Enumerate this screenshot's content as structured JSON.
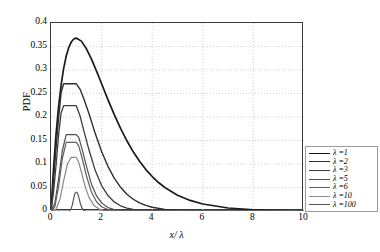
{
  "chart_data": {
    "type": "line",
    "title": "",
    "xlabel": "x/ λ",
    "ylabel": "PDF",
    "xlim": [
      0,
      10
    ],
    "ylim": [
      0,
      0.4
    ],
    "xticks": [
      0,
      2,
      4,
      6,
      8,
      10
    ],
    "yticks": [
      0,
      0.05,
      0.1,
      0.15,
      0.2,
      0.25,
      0.3,
      0.35,
      0.4
    ],
    "xtick_labels": [
      "0",
      "2",
      "4",
      "6",
      "8",
      "10"
    ],
    "ytick_labels": [
      "0",
      "0.05",
      "0.1",
      "0.15",
      "0.2",
      "0.25",
      "0.3",
      "0.35",
      "0.4"
    ],
    "grid": true,
    "grid_style": "dotted",
    "legend_position": "right-outside",
    "series": [
      {
        "name": "λ =1",
        "lambda": 1,
        "color": "#1a1a1a",
        "width": 1.7,
        "peak_x": 1.0,
        "peak_y": 0.368,
        "x": [
          0,
          0.1,
          0.2,
          0.3,
          0.4,
          0.5,
          0.6,
          0.7,
          0.8,
          0.9,
          1.0,
          1.2,
          1.4,
          1.6,
          1.8,
          2.0,
          2.25,
          2.5,
          2.75,
          3.0,
          3.25,
          3.5,
          3.75,
          4.0,
          4.25,
          4.5,
          5.0,
          5.5,
          6.0,
          7.0,
          8.0,
          9.0,
          10.0
        ],
        "y": [
          0.0,
          0.0905,
          0.1637,
          0.2222,
          0.2681,
          0.3033,
          0.3293,
          0.3476,
          0.3595,
          0.3659,
          0.3679,
          0.3614,
          0.3452,
          0.323,
          0.2975,
          0.2707,
          0.2371,
          0.2052,
          0.1758,
          0.1494,
          0.1259,
          0.1057,
          0.0881,
          0.0733,
          0.0606,
          0.05,
          0.0337,
          0.0225,
          0.0149,
          0.0064,
          0.0027,
          0.0011,
          0.0005
        ]
      },
      {
        "name": "λ =2",
        "lambda": 2,
        "color": "#2e2e2e",
        "width": 1.4,
        "peak_x": 1.0,
        "peak_y": 0.271,
        "x": [
          0,
          0.1,
          0.2,
          0.3,
          0.4,
          0.5,
          0.6,
          0.7,
          0.8,
          0.9,
          1.0,
          1.15,
          1.3,
          1.5,
          1.75,
          2.0,
          2.25,
          2.5,
          2.75,
          3.0,
          3.25,
          3.5,
          3.75,
          4.0,
          4.5,
          5.0,
          5.5,
          6.0,
          7.0,
          8.0,
          10.0
        ],
        "y": [
          0.0,
          0.0655,
          0.1341,
          0.1976,
          0.2518,
          0.2707,
          0.2707,
          0.2707,
          0.2707,
          0.2707,
          0.2707,
          0.2588,
          0.2384,
          0.2075,
          0.1647,
          0.1268,
          0.095,
          0.0698,
          0.0504,
          0.0357,
          0.025,
          0.0173,
          0.0118,
          0.008,
          0.0035,
          0.0015,
          0.0006,
          0.0003,
          0.0001,
          0.0,
          0.0
        ]
      },
      {
        "name": "λ =3",
        "lambda": 3,
        "color": "#3d3d3d",
        "width": 1.3,
        "peak_x": 1.0,
        "peak_y": 0.224,
        "x": [
          0,
          0.1,
          0.2,
          0.3,
          0.4,
          0.5,
          0.6,
          0.7,
          0.8,
          0.9,
          1.0,
          1.15,
          1.3,
          1.5,
          1.75,
          2.0,
          2.25,
          2.5,
          2.75,
          3.0,
          3.25,
          3.5,
          3.75,
          4.0,
          4.5,
          5.0,
          6.0,
          7.0,
          10.0
        ],
        "y": [
          0.0,
          0.0399,
          0.0974,
          0.1612,
          0.2089,
          0.224,
          0.224,
          0.224,
          0.224,
          0.224,
          0.224,
          0.202,
          0.1706,
          0.1302,
          0.086,
          0.0541,
          0.0328,
          0.0193,
          0.0111,
          0.0062,
          0.0034,
          0.0019,
          0.001,
          0.0005,
          0.0001,
          0.0,
          0.0,
          0.0,
          0.0
        ]
      },
      {
        "name": "λ =5",
        "lambda": 5,
        "color": "#4f4f4f",
        "width": 1.2,
        "peak_x": 1.0,
        "peak_y": 0.163,
        "x": [
          0,
          0.15,
          0.3,
          0.45,
          0.6,
          0.75,
          0.9,
          1.0,
          1.1,
          1.25,
          1.4,
          1.6,
          1.8,
          2.0,
          2.25,
          2.5,
          2.75,
          3.0,
          3.5,
          4.0,
          5.0,
          6.0,
          10.0
        ],
        "y": [
          0.0,
          0.016,
          0.0684,
          0.1287,
          0.1625,
          0.1625,
          0.1625,
          0.1625,
          0.156,
          0.1275,
          0.0948,
          0.057,
          0.0321,
          0.0173,
          0.0074,
          0.003,
          0.0012,
          0.0005,
          0.0001,
          0.0,
          0.0,
          0.0,
          0.0
        ]
      },
      {
        "name": "λ =6",
        "lambda": 6,
        "color": "#606060",
        "width": 1.2,
        "peak_x": 1.0,
        "peak_y": 0.146,
        "x": [
          0,
          0.15,
          0.3,
          0.45,
          0.6,
          0.75,
          0.9,
          1.0,
          1.1,
          1.25,
          1.4,
          1.6,
          1.8,
          2.0,
          2.25,
          2.5,
          2.75,
          3.0,
          3.5,
          4.0,
          5.0,
          10.0
        ],
        "y": [
          0.0,
          0.009,
          0.052,
          0.112,
          0.146,
          0.146,
          0.146,
          0.146,
          0.138,
          0.108,
          0.075,
          0.04,
          0.0196,
          0.009,
          0.0031,
          0.001,
          0.0003,
          0.0001,
          0.0,
          0.0,
          0.0,
          0.0
        ]
      },
      {
        "name": "λ =10",
        "lambda": 10,
        "color": "#8a8a8a",
        "width": 1.2,
        "peak_x": 1.0,
        "peak_y": 0.114,
        "x": [
          0,
          0.2,
          0.35,
          0.5,
          0.65,
          0.8,
          0.95,
          1.0,
          1.1,
          1.2,
          1.35,
          1.5,
          1.7,
          1.9,
          2.1,
          2.4,
          2.7,
          3.0,
          3.5,
          10.0
        ],
        "y": [
          0.0,
          0.004,
          0.024,
          0.064,
          0.1,
          0.114,
          0.114,
          0.114,
          0.103,
          0.083,
          0.052,
          0.029,
          0.0115,
          0.0041,
          0.0014,
          0.0003,
          0.0001,
          0.0,
          0.0,
          0.0
        ]
      },
      {
        "name": "λ =100",
        "lambda": 100,
        "color": "#555555",
        "width": 1.2,
        "peak_x": 1.0,
        "peak_y": 0.04,
        "x": [
          0,
          0.72,
          0.78,
          0.84,
          0.9,
          0.95,
          1.0,
          1.05,
          1.1,
          1.16,
          1.22,
          1.28,
          1.35,
          10.0
        ],
        "y": [
          0.0,
          0.0,
          0.0035,
          0.012,
          0.028,
          0.038,
          0.04,
          0.038,
          0.0285,
          0.016,
          0.0065,
          0.0018,
          0.0,
          0.0
        ]
      }
    ]
  },
  "axes": {
    "ylabel_text": "PDF",
    "xlabel_num": "x/",
    "xlabel_den": " λ"
  }
}
